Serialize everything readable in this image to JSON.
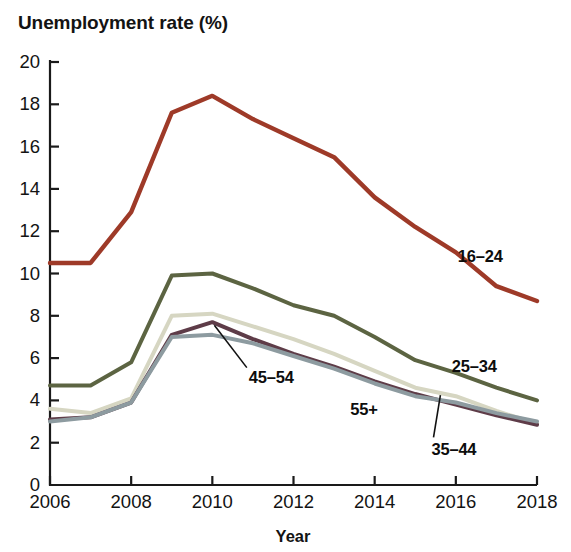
{
  "chart_data": {
    "type": "line",
    "title": "Unemployment rate (%)",
    "xlabel": "Year",
    "ylabel": "Unemployment rate (%)",
    "x": [
      2006,
      2007,
      2008,
      2009,
      2010,
      2011,
      2012,
      2013,
      2014,
      2015,
      2016,
      2017,
      2018
    ],
    "xlim": [
      2006,
      2018
    ],
    "ylim": [
      0,
      20
    ],
    "xticks": [
      "2006",
      "2008",
      "2010",
      "2012",
      "2014",
      "2016",
      "2018"
    ],
    "xtick_values": [
      2006,
      2008,
      2010,
      2012,
      2014,
      2016,
      2018
    ],
    "yticks": [
      "0",
      "2",
      "4",
      "6",
      "8",
      "10",
      "12",
      "14",
      "16",
      "18",
      "20"
    ],
    "ytick_values": [
      0,
      2,
      4,
      6,
      8,
      10,
      12,
      14,
      16,
      18,
      20
    ],
    "grid": false,
    "legend_position": "inline-annotations",
    "series": [
      {
        "name": "16–24",
        "color": "#9e3a28",
        "values": [
          10.5,
          10.5,
          12.9,
          17.6,
          18.4,
          17.3,
          16.4,
          15.5,
          13.6,
          12.2,
          11.0,
          9.4,
          8.7
        ],
        "label_x": 2016.05,
        "label_y": 10.8,
        "leader_line": false
      },
      {
        "name": "25–34",
        "color": "#5c6442",
        "values": [
          4.7,
          4.7,
          5.8,
          9.9,
          10.0,
          9.3,
          8.5,
          8.0,
          7.0,
          5.9,
          5.3,
          4.6,
          4.0
        ],
        "label_x": 2015.9,
        "label_y": 5.6,
        "leader_line": false
      },
      {
        "name": "35–44",
        "color": "#d6d6c2",
        "values": [
          3.6,
          3.4,
          4.1,
          8.0,
          8.1,
          7.5,
          6.9,
          6.2,
          5.4,
          4.6,
          4.2,
          3.5,
          2.9
        ],
        "label_x": 2015.4,
        "label_y": 1.65,
        "leader_line": true,
        "leader_from": [
          2015.45,
          2.25
        ],
        "leader_to": [
          2015.62,
          4.25
        ]
      },
      {
        "name": "45–54",
        "color": "#5e3c48",
        "values": [
          3.1,
          3.2,
          3.9,
          7.1,
          7.7,
          6.9,
          6.2,
          5.6,
          4.9,
          4.3,
          3.8,
          3.3,
          2.85
        ],
        "label_x": 2010.9,
        "label_y": 5.05,
        "leader_line": true,
        "leader_from": [
          2010.85,
          5.55
        ],
        "leader_to": [
          2010.05,
          7.55
        ]
      },
      {
        "name": "55+",
        "color": "#8d9ba0",
        "values": [
          3.0,
          3.2,
          3.9,
          7.0,
          7.1,
          6.7,
          6.1,
          5.5,
          4.8,
          4.2,
          3.9,
          3.4,
          3.0
        ],
        "label_x": 2013.4,
        "label_y": 3.55,
        "leader_line": false
      }
    ]
  },
  "axis": {
    "color": "#1a1a1a"
  }
}
